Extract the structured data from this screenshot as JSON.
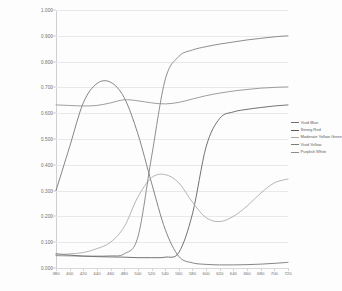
{
  "chart_data": {
    "type": "line",
    "title": "",
    "xlabel": "",
    "ylabel": "",
    "xlim": [
      380,
      720
    ],
    "ylim": [
      0.0,
      1.0
    ],
    "grid": true,
    "legend_position": "right",
    "x": [
      380,
      400,
      420,
      440,
      460,
      480,
      500,
      520,
      540,
      560,
      580,
      600,
      620,
      640,
      660,
      680,
      700,
      720
    ],
    "y_ticks": [
      "0.000",
      "0.100",
      "0.200",
      "0.300",
      "0.400",
      "0.500",
      "0.600",
      "0.700",
      "0.800",
      "0.900",
      "1.000"
    ],
    "x_ticks": [
      "380",
      "400",
      "420",
      "440",
      "460",
      "480",
      "500",
      "520",
      "540",
      "560",
      "580",
      "600",
      "620",
      "640",
      "660",
      "680",
      "700",
      "720"
    ],
    "series": [
      {
        "name": "Vivid Blue",
        "color": "#6f6f6f",
        "values": [
          0.3,
          0.47,
          0.64,
          0.715,
          0.72,
          0.66,
          0.52,
          0.33,
          0.15,
          0.045,
          0.02,
          0.014,
          0.012,
          0.012,
          0.013,
          0.015,
          0.018,
          0.022
        ]
      },
      {
        "name": "Strong Red",
        "color": "#585858",
        "values": [
          0.055,
          0.05,
          0.046,
          0.044,
          0.043,
          0.042,
          0.04,
          0.04,
          0.042,
          0.06,
          0.21,
          0.47,
          0.58,
          0.605,
          0.615,
          0.622,
          0.628,
          0.632
        ]
      },
      {
        "name": "Moderate Yellow Green",
        "color": "#a8a8a8",
        "values": [
          0.052,
          0.055,
          0.06,
          0.075,
          0.1,
          0.16,
          0.275,
          0.35,
          0.362,
          0.33,
          0.255,
          0.195,
          0.18,
          0.2,
          0.24,
          0.29,
          0.33,
          0.345
        ]
      },
      {
        "name": "Vivid Yellow",
        "color": "#7a7a7a",
        "values": [
          0.048,
          0.047,
          0.046,
          0.046,
          0.047,
          0.055,
          0.12,
          0.43,
          0.73,
          0.82,
          0.845,
          0.858,
          0.868,
          0.876,
          0.884,
          0.89,
          0.896,
          0.9
        ]
      },
      {
        "name": "Purplish White",
        "color": "#8c8c8c",
        "values": [
          0.632,
          0.63,
          0.628,
          0.63,
          0.64,
          0.652,
          0.648,
          0.64,
          0.636,
          0.642,
          0.655,
          0.668,
          0.678,
          0.686,
          0.692,
          0.697,
          0.7,
          0.702
        ]
      }
    ]
  }
}
